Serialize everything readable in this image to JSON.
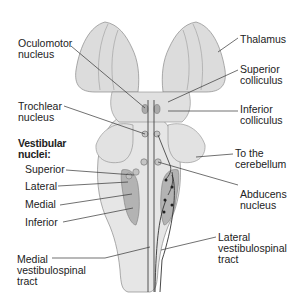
{
  "diagram": {
    "colors": {
      "tissue_light": "#e3e3e3",
      "tissue_mid": "#d4d4d4",
      "nuclei_dark": "#a9a9a9",
      "outline": "#8a8a8a",
      "tract_line": "#333333",
      "text": "#222222"
    },
    "labels": {
      "oculomotor": "Oculomotor\nnucleus",
      "thalamus": "Thalamus",
      "superior_colliculus": "Superior\ncolliculus",
      "trochlear": "Trochlear\nnucleus",
      "inferior_colliculus": "Inferior\ncolliculus",
      "vestibular_heading": "Vestibular\nnuclei:",
      "to_cerebellum": "To the\ncerebellum",
      "vest_superior": "Superior",
      "vest_lateral": "Lateral",
      "vest_medial": "Medial",
      "vest_inferior": "Inferior",
      "abducens": "Abducens\nnucleus",
      "lateral_vst": "Lateral\nvestibulospinal\ntract",
      "medial_vst": "Medial\nvestibulospinal\ntract"
    }
  }
}
